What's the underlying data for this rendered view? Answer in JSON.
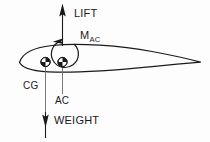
{
  "figure": {
    "kind": "airfoil-force-diagram",
    "background_color": "#fdfdfd",
    "ink_color": "#1a1a1a"
  },
  "labels": {
    "lift": "LIFT",
    "moment_symbol": "M",
    "moment_subscript": "AC",
    "cg": "CG",
    "ac": "AC",
    "weight": "WEIGHT"
  },
  "markers": {
    "cg_symbol": "cg-quartered-circle",
    "ac_symbol": "ac-quartered-circle"
  },
  "arrows": {
    "lift_direction": "up",
    "weight_direction": "down",
    "moment_direction": "counterclockwise"
  }
}
